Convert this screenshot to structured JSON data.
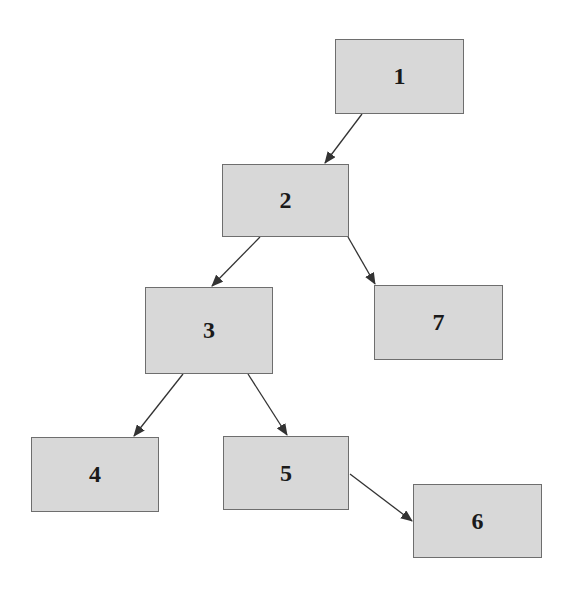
{
  "diagram": {
    "type": "tree",
    "colors": {
      "node_fill": "#d8d8d8",
      "node_border": "#6e6e6e",
      "edge": "#333333",
      "label": "#1a1a1a"
    },
    "nodes": [
      {
        "id": "1",
        "label": "1",
        "x": 335,
        "y": 39,
        "w": 129,
        "h": 75
      },
      {
        "id": "2",
        "label": "2",
        "x": 222,
        "y": 164,
        "w": 127,
        "h": 73
      },
      {
        "id": "3",
        "label": "3",
        "x": 145,
        "y": 287,
        "w": 128,
        "h": 87
      },
      {
        "id": "7",
        "label": "7",
        "x": 374,
        "y": 285,
        "w": 129,
        "h": 75
      },
      {
        "id": "4",
        "label": "4",
        "x": 31,
        "y": 437,
        "w": 128,
        "h": 75
      },
      {
        "id": "5",
        "label": "5",
        "x": 223,
        "y": 436,
        "w": 126,
        "h": 74
      },
      {
        "id": "6",
        "label": "6",
        "x": 413,
        "y": 484,
        "w": 129,
        "h": 74
      }
    ],
    "edges": [
      {
        "from": "1",
        "to": "2",
        "x1": 362,
        "y1": 114,
        "x2": 325,
        "y2": 163
      },
      {
        "from": "2",
        "to": "3",
        "x1": 260,
        "y1": 237,
        "x2": 212,
        "y2": 286
      },
      {
        "from": "2",
        "to": "7",
        "x1": 348,
        "y1": 237,
        "x2": 375,
        "y2": 284
      },
      {
        "from": "3",
        "to": "4",
        "x1": 183,
        "y1": 374,
        "x2": 134,
        "y2": 436
      },
      {
        "from": "3",
        "to": "5",
        "x1": 248,
        "y1": 374,
        "x2": 287,
        "y2": 435
      },
      {
        "from": "5",
        "to": "6",
        "x1": 350,
        "y1": 474,
        "x2": 412,
        "y2": 521
      }
    ]
  }
}
